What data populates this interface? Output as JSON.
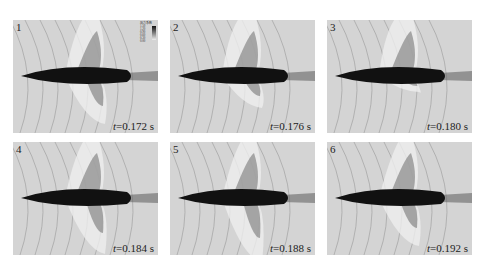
{
  "figure": {
    "panels": [
      {
        "num": "1",
        "t_label": "t",
        "t_value": "=0.172 s",
        "x": 13,
        "y": 20,
        "lobe_up": -30,
        "lobe_down": 30
      },
      {
        "num": "2",
        "t_label": "t",
        "t_value": "=0.176 s",
        "x": 170,
        "y": 20,
        "lobe_up": -40,
        "lobe_down": 20
      },
      {
        "num": "3",
        "t_label": "t",
        "t_value": "=0.180 s",
        "x": 327,
        "y": 20,
        "lobe_up": -45,
        "lobe_down": 10
      },
      {
        "num": "4",
        "t_label": "t",
        "t_value": "=0.184 s",
        "x": 13,
        "y": 142,
        "lobe_up": -25,
        "lobe_down": 35
      },
      {
        "num": "5",
        "t_label": "t",
        "t_value": "=0.188 s",
        "x": 170,
        "y": 142,
        "lobe_up": -20,
        "lobe_down": 40
      },
      {
        "num": "6",
        "t_label": "t",
        "t_value": "=0.192 s",
        "x": 327,
        "y": 142,
        "lobe_up": -15,
        "lobe_down": 30
      }
    ],
    "legend": {
      "title": "压力系数",
      "values": [
        "1.50",
        "1.20",
        "0.90",
        "0.60",
        "0.30",
        "0.00"
      ]
    }
  }
}
